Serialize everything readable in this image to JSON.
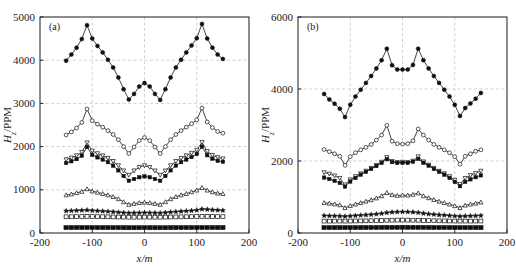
{
  "figure": {
    "background": "#ffffff",
    "ink_color": "#141414",
    "grid_color": "#bdbdbd"
  },
  "panels": [
    {
      "id": "a",
      "label": "(a)",
      "xlabel": "x/m",
      "ylabel_main": "H",
      "ylabel_sub": "z",
      "ylabel_rest": "/PPM",
      "ylabel_full": "Hz/PPM",
      "xticks": [
        "-200",
        "-100",
        "0",
        "100",
        "200"
      ],
      "yticks": [
        "0",
        "1000",
        "2000",
        "3000",
        "4000",
        "5000"
      ]
    },
    {
      "id": "b",
      "label": "(b)",
      "xlabel": "x/m",
      "ylabel_main": "H",
      "ylabel_sub": "z",
      "ylabel_rest": "/PPM",
      "ylabel_full": "Hz/PPM",
      "xticks": [
        "-200",
        "-100",
        "0",
        "100",
        "200"
      ],
      "yticks": [
        "0",
        "2000",
        "4000",
        "6000"
      ]
    }
  ],
  "chart_data": [
    {
      "type": "line",
      "panel": "a",
      "title": "(a)",
      "xlabel": "x/m",
      "ylabel": "Hz/PPM",
      "xlim": [
        -200,
        200
      ],
      "ylim": [
        0,
        5000
      ],
      "xticks": [
        -200,
        -100,
        0,
        100,
        200
      ],
      "yticks": [
        0,
        1000,
        2000,
        3000,
        4000,
        5000
      ],
      "grid": true,
      "legend": "none",
      "x": [
        -150,
        -140,
        -130,
        -120,
        -110,
        -100,
        -90,
        -80,
        -70,
        -60,
        -50,
        -40,
        -30,
        -20,
        -10,
        0,
        10,
        20,
        30,
        40,
        50,
        60,
        70,
        80,
        90,
        100,
        110,
        120,
        130,
        140,
        150
      ],
      "series": [
        {
          "name": "series-1",
          "marker": "filled-circle",
          "values": [
            3990,
            4130,
            4290,
            4490,
            4810,
            4500,
            4330,
            4180,
            4010,
            3830,
            3600,
            3330,
            3090,
            3220,
            3390,
            3470,
            3390,
            3220,
            3080,
            3330,
            3600,
            3830,
            4010,
            4180,
            4340,
            4510,
            4840,
            4500,
            4290,
            4130,
            4030
          ]
        },
        {
          "name": "series-2",
          "marker": "open-circle",
          "values": [
            2270,
            2340,
            2430,
            2560,
            2870,
            2600,
            2520,
            2450,
            2370,
            2280,
            2160,
            2000,
            1840,
            1990,
            2140,
            2210,
            2140,
            1990,
            1840,
            2000,
            2160,
            2280,
            2370,
            2450,
            2530,
            2620,
            2890,
            2570,
            2440,
            2350,
            2310
          ]
        },
        {
          "name": "series-3",
          "marker": "down-triangle",
          "values": [
            1700,
            1740,
            1790,
            1870,
            2090,
            1900,
            1840,
            1790,
            1730,
            1660,
            1560,
            1440,
            1340,
            1440,
            1520,
            1560,
            1520,
            1440,
            1340,
            1440,
            1560,
            1660,
            1730,
            1790,
            1850,
            1920,
            2100,
            1890,
            1800,
            1750,
            1720
          ]
        },
        {
          "name": "series-4",
          "marker": "filled-square",
          "values": [
            1620,
            1660,
            1710,
            1790,
            1990,
            1810,
            1750,
            1700,
            1640,
            1560,
            1450,
            1320,
            1210,
            1250,
            1290,
            1310,
            1290,
            1250,
            1210,
            1320,
            1450,
            1560,
            1640,
            1700,
            1760,
            1830,
            2000,
            1800,
            1720,
            1670,
            1650
          ]
        },
        {
          "name": "series-5",
          "marker": "open-triangle",
          "values": [
            880,
            900,
            930,
            960,
            1020,
            970,
            940,
            910,
            880,
            840,
            790,
            720,
            660,
            680,
            700,
            710,
            700,
            680,
            660,
            720,
            790,
            840,
            880,
            910,
            950,
            990,
            1050,
            990,
            950,
            920,
            910
          ]
        },
        {
          "name": "series-6",
          "marker": "star",
          "values": [
            510,
            515,
            520,
            525,
            530,
            520,
            512,
            505,
            498,
            490,
            480,
            470,
            462,
            465,
            468,
            470,
            468,
            465,
            462,
            472,
            482,
            492,
            500,
            508,
            516,
            528,
            552,
            545,
            535,
            528,
            522
          ]
        },
        {
          "name": "series-7",
          "marker": "open-square",
          "values": [
            375,
            376,
            378,
            380,
            382,
            380,
            378,
            376,
            374,
            372,
            370,
            368,
            366,
            366,
            367,
            368,
            367,
            366,
            366,
            368,
            370,
            372,
            374,
            376,
            378,
            381,
            385,
            383,
            381,
            379,
            378
          ]
        },
        {
          "name": "series-8",
          "marker": "filled-square-bottom",
          "values": [
            125,
            125,
            126,
            126,
            127,
            126,
            126,
            125,
            125,
            124,
            124,
            123,
            123,
            123,
            123,
            124,
            123,
            123,
            123,
            123,
            124,
            124,
            125,
            125,
            126,
            126,
            127,
            127,
            126,
            126,
            125
          ]
        }
      ]
    },
    {
      "type": "line",
      "panel": "b",
      "title": "(b)",
      "xlabel": "x/m",
      "ylabel": "Hz/PPM",
      "xlim": [
        -200,
        200
      ],
      "ylim": [
        0,
        6000
      ],
      "xticks": [
        -200,
        -100,
        0,
        100,
        200
      ],
      "yticks": [
        0,
        2000,
        4000,
        6000
      ],
      "grid": true,
      "legend": "none",
      "x": [
        -150,
        -140,
        -130,
        -120,
        -110,
        -100,
        -90,
        -80,
        -70,
        -60,
        -50,
        -40,
        -30,
        -20,
        -10,
        0,
        10,
        20,
        30,
        40,
        50,
        60,
        70,
        80,
        90,
        100,
        110,
        120,
        130,
        140,
        150
      ],
      "series": [
        {
          "name": "series-1",
          "marker": "filled-circle",
          "values": [
            3860,
            3710,
            3590,
            3450,
            3220,
            3560,
            3790,
            3980,
            4170,
            4360,
            4570,
            4800,
            5120,
            4660,
            4540,
            4540,
            4540,
            4670,
            5120,
            4800,
            4570,
            4360,
            4170,
            3980,
            3790,
            3560,
            3250,
            3470,
            3600,
            3730,
            3890
          ]
        },
        {
          "name": "series-2",
          "marker": "open-circle",
          "values": [
            2320,
            2260,
            2200,
            2130,
            1880,
            2120,
            2230,
            2310,
            2380,
            2460,
            2580,
            2720,
            2990,
            2550,
            2480,
            2470,
            2480,
            2560,
            2890,
            2720,
            2580,
            2460,
            2380,
            2310,
            2230,
            2120,
            1910,
            2130,
            2200,
            2270,
            2310
          ]
        },
        {
          "name": "series-3",
          "marker": "down-triangle",
          "values": [
            1680,
            1640,
            1590,
            1520,
            1340,
            1480,
            1570,
            1650,
            1720,
            1800,
            1880,
            1970,
            2100,
            1990,
            1960,
            1970,
            1960,
            2000,
            2120,
            1980,
            1890,
            1800,
            1720,
            1650,
            1570,
            1470,
            1350,
            1520,
            1600,
            1660,
            1720
          ]
        },
        {
          "name": "series-4",
          "marker": "filled-square",
          "values": [
            1540,
            1500,
            1450,
            1390,
            1290,
            1430,
            1530,
            1620,
            1700,
            1780,
            1860,
            1950,
            2050,
            1970,
            1950,
            1950,
            1950,
            1980,
            2060,
            1950,
            1870,
            1780,
            1700,
            1620,
            1530,
            1420,
            1300,
            1420,
            1490,
            1550,
            1600
          ]
        },
        {
          "name": "series-5",
          "marker": "open-triangle",
          "values": [
            840,
            825,
            805,
            780,
            700,
            760,
            800,
            840,
            880,
            920,
            970,
            1030,
            1120,
            1060,
            1040,
            1050,
            1050,
            1070,
            1110,
            1030,
            975,
            925,
            880,
            840,
            800,
            755,
            700,
            770,
            800,
            825,
            855
          ]
        },
        {
          "name": "series-6",
          "marker": "star",
          "values": [
            480,
            477,
            474,
            470,
            462,
            472,
            482,
            492,
            502,
            512,
            524,
            540,
            565,
            578,
            585,
            588,
            585,
            580,
            568,
            545,
            528,
            515,
            504,
            494,
            484,
            472,
            462,
            470,
            474,
            478,
            484
          ]
        },
        {
          "name": "series-7",
          "marker": "open-square",
          "values": [
            330,
            330,
            331,
            331,
            330,
            332,
            334,
            336,
            338,
            341,
            344,
            348,
            353,
            356,
            358,
            359,
            358,
            356,
            353,
            348,
            344,
            341,
            338,
            336,
            334,
            332,
            330,
            331,
            331,
            331,
            332
          ]
        },
        {
          "name": "series-8",
          "marker": "filled-square-bottom",
          "values": [
            150,
            150,
            150,
            150,
            150,
            151,
            151,
            152,
            152,
            153,
            154,
            155,
            156,
            157,
            157,
            158,
            157,
            157,
            156,
            155,
            154,
            153,
            152,
            152,
            151,
            151,
            150,
            150,
            150,
            150,
            150
          ]
        }
      ]
    }
  ]
}
